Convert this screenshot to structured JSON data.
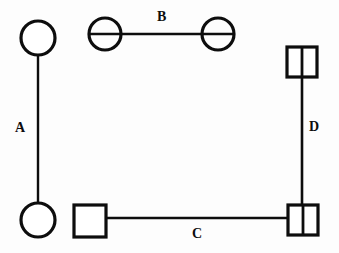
{
  "diagram": {
    "background_color": "#fdfdfd",
    "stroke_color": "#0d0d0d",
    "fill_color": "#ffffff",
    "width": 339,
    "height": 253,
    "pairs": [
      {
        "id": "A",
        "label": "A",
        "orientation": "vertical",
        "label_x": 15,
        "label_y": 121,
        "connector": {
          "x1": 38,
          "y1": 55,
          "x2": 38,
          "y2": 203
        },
        "symbols": [
          {
            "name": "circle-plain-top-left",
            "shape": "circle",
            "marking": "none",
            "cx": 38,
            "cy": 38,
            "r": 17
          },
          {
            "name": "circle-plain-bottom-left",
            "shape": "circle",
            "marking": "none",
            "cx": 38,
            "cy": 220,
            "r": 17
          }
        ]
      },
      {
        "id": "B",
        "label": "B",
        "orientation": "horizontal",
        "label_x": 157,
        "label_y": 10,
        "connector": {
          "x1": 105,
          "y1": 34,
          "x2": 218,
          "y2": 34
        },
        "symbols": [
          {
            "name": "circle-bisected-left",
            "shape": "circle",
            "marking": "horizontal-bisect",
            "cx": 105,
            "cy": 34,
            "r": 16
          },
          {
            "name": "circle-bisected-right",
            "shape": "circle",
            "marking": "horizontal-bisect",
            "cx": 218,
            "cy": 34,
            "r": 16
          }
        ]
      },
      {
        "id": "C",
        "label": "C",
        "orientation": "horizontal",
        "label_x": 192,
        "label_y": 227,
        "connector": {
          "x1": 106,
          "y1": 218,
          "x2": 287,
          "y2": 218
        },
        "symbols": [
          {
            "name": "square-plain-bottom-left",
            "shape": "square",
            "marking": "none",
            "x": 73,
            "y": 204,
            "size": 33
          },
          {
            "name": "square-divided-bottom-right",
            "shape": "square",
            "marking": "vertical-divider",
            "x": 287,
            "y": 204,
            "size": 31
          }
        ]
      },
      {
        "id": "D",
        "label": "D",
        "orientation": "vertical",
        "label_x": 309,
        "label_y": 120,
        "connector": {
          "x1": 302,
          "y1": 78,
          "x2": 302,
          "y2": 204
        },
        "symbols": [
          {
            "name": "square-divided-top-right",
            "shape": "square",
            "marking": "vertical-divider",
            "x": 286,
            "y": 46,
            "size": 32
          },
          {
            "name": "square-divided-bottom-right",
            "shape": "square",
            "marking": "vertical-divider",
            "x": 287,
            "y": 204,
            "size": 31
          }
        ]
      }
    ]
  }
}
